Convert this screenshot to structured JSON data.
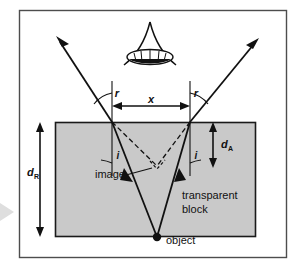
{
  "figure": {
    "labels": {
      "angle_r_left": "r",
      "angle_r_right": "r",
      "angle_i_left": "i",
      "angle_i_right": "i",
      "separation_x": "x",
      "depth_apparent": "d",
      "depth_apparent_sub": "A",
      "depth_real": "d",
      "depth_real_sub": "R",
      "image": "image",
      "object": "object",
      "block_line1": "transparent",
      "block_line2": "block"
    },
    "colors": {
      "block_fill": "#c9c9c9",
      "block_stroke": "#1a1a1a",
      "frame_stroke": "#4d4d4d",
      "ray_stroke": "#111111",
      "dashed_stroke": "#111111",
      "background": "#ffffff",
      "side_marker": "#d8d8d8"
    },
    "geometry": {
      "frame": {
        "x": 19,
        "y": 10,
        "width": 268,
        "height": 248
      },
      "block": {
        "x": 55,
        "y": 122,
        "width": 201,
        "height": 115
      },
      "object_point": {
        "x": 157,
        "y": 237
      },
      "image_point": {
        "x": 157,
        "y": 166
      },
      "surface_left_hit": {
        "x": 112,
        "y": 122
      },
      "surface_right_hit": {
        "x": 190,
        "y": 122
      },
      "eye_center": {
        "x": 150,
        "y": 55
      }
    }
  }
}
